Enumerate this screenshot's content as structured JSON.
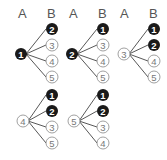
{
  "headers": [
    {
      "a": "A",
      "b": "B",
      "ax": 23,
      "bx": 52
    },
    {
      "a": "A",
      "b": "B",
      "ax": 74,
      "bx": 103
    },
    {
      "a": "A",
      "b": "B",
      "ax": 125,
      "bx": 154
    }
  ],
  "trees": [
    {
      "root": {
        "label": "1",
        "filled": true
      },
      "rx": 21,
      "ry": 54,
      "cx": 52,
      "cy": [
        29,
        45,
        61,
        77
      ],
      "children": [
        {
          "label": "2",
          "filled": true
        },
        {
          "label": "3",
          "filled": false
        },
        {
          "label": "4",
          "filled": false
        },
        {
          "label": "5",
          "filled": false
        }
      ]
    },
    {
      "root": {
        "label": "2",
        "filled": true
      },
      "rx": 72,
      "ry": 54,
      "cx": 103,
      "cy": [
        29,
        45,
        61,
        77
      ],
      "children": [
        {
          "label": "1",
          "filled": true
        },
        {
          "label": "3",
          "filled": false
        },
        {
          "label": "4",
          "filled": false
        },
        {
          "label": "5",
          "filled": false
        }
      ]
    },
    {
      "root": {
        "label": "3",
        "filled": false
      },
      "rx": 124,
      "ry": 54,
      "cx": 154,
      "cy": [
        29,
        45,
        61,
        77
      ],
      "children": [
        {
          "label": "1",
          "filled": true
        },
        {
          "label": "2",
          "filled": true
        },
        {
          "label": "4",
          "filled": false
        },
        {
          "label": "5",
          "filled": false
        }
      ]
    },
    {
      "root": {
        "label": "4",
        "filled": false
      },
      "rx": 23,
      "ry": 121,
      "cx": 52,
      "cy": [
        95,
        111,
        127,
        143
      ],
      "children": [
        {
          "label": "1",
          "filled": true
        },
        {
          "label": "2",
          "filled": true
        },
        {
          "label": "3",
          "filled": false
        },
        {
          "label": "5",
          "filled": false
        }
      ]
    },
    {
      "root": {
        "label": "5",
        "filled": false
      },
      "rx": 74,
      "ry": 121,
      "cx": 103,
      "cy": [
        95,
        111,
        127,
        143
      ],
      "children": [
        {
          "label": "1",
          "filled": true
        },
        {
          "label": "2",
          "filled": true
        },
        {
          "label": "3",
          "filled": false
        },
        {
          "label": "4",
          "filled": false
        }
      ]
    }
  ],
  "colors": {
    "filled": "#1a1a1a",
    "outline": "#888888",
    "line": "#444444",
    "text_light": "#777777"
  }
}
